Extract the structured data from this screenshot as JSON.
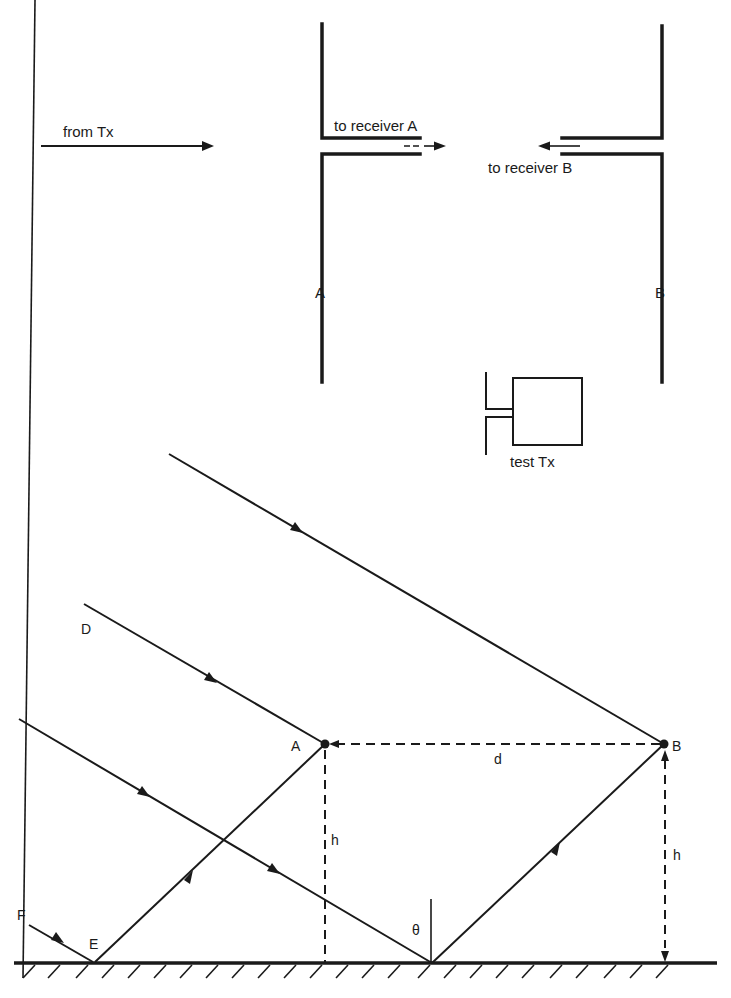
{
  "top_diagram": {
    "input_label": "from Tx",
    "antenna_a": {
      "label": "A",
      "feed_label": "to receiver A"
    },
    "antenna_b": {
      "label": "B",
      "feed_label": "to receiver B"
    }
  },
  "test_transmitter": {
    "label": "test Tx"
  },
  "bottom_diagram": {
    "points": {
      "A": "A",
      "B": "B",
      "D": "D",
      "E": "E",
      "F": "F"
    },
    "separation_label": "d",
    "height_label_a": "h",
    "height_label_b": "h",
    "angle_label": "θ"
  },
  "colors": {
    "ink": "#1a1a1a",
    "background": "#ffffff"
  }
}
